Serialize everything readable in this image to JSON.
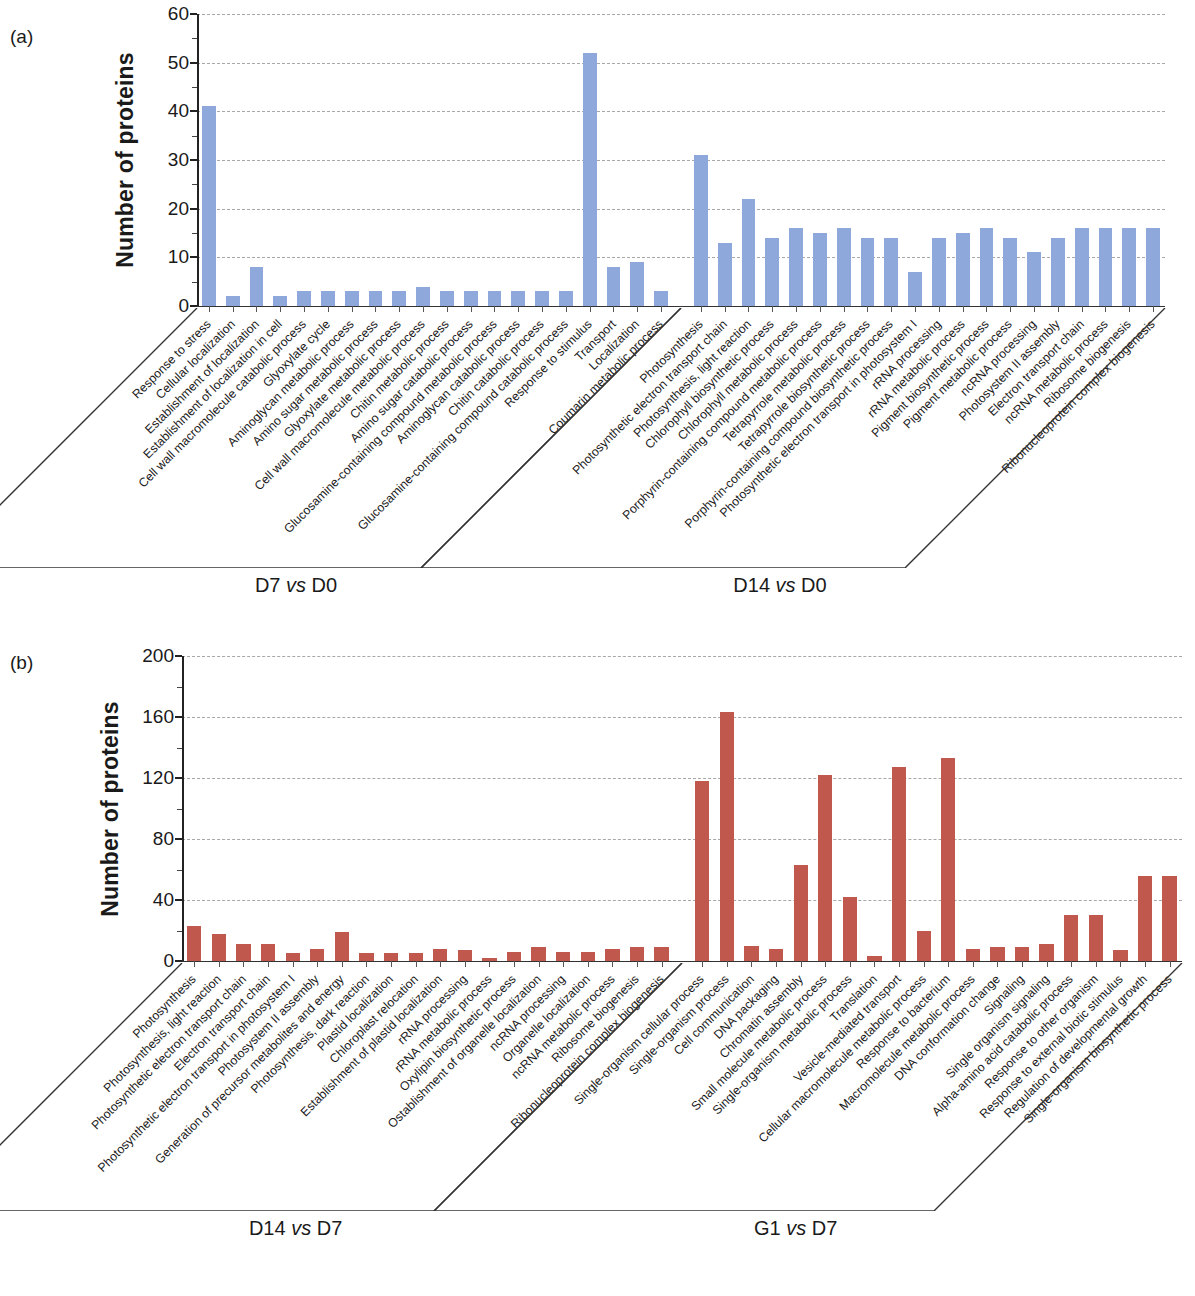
{
  "figure": {
    "panels": [
      {
        "letter": "(a)",
        "ylabel": "Number of proteins",
        "yticks": [
          "0",
          "10",
          "20",
          "30",
          "40",
          "50",
          "60"
        ],
        "groups": [
          {
            "title_prefix": "D7 ",
            "title_vs": "vs",
            "title_suffix": " D0",
            "categories": [
              "Response to stress",
              "Cellular localization",
              "Establishment of localization",
              "Establishment of localization in cell",
              "Cell wall macromolecule catabolic process",
              "Glyoxylate cycle",
              "Aminoglycan metabolic process",
              "Amino sugar metabolic process",
              "Glyoxylate metabolic process",
              "Cell wall macromolecule metabolic process",
              "Chitin metabolic process",
              "Amino sugar catabolic process",
              "Glucosamine-containing compound metabolic process",
              "Aminoglycan catabolic process",
              "Chitin catabolic process",
              "Glucosamine-containing compound catabolic process",
              "Response to stimulus",
              "Transport",
              "Localization",
              "Coumarin metabolic process"
            ],
            "values": [
              41,
              2,
              8,
              2,
              3,
              3,
              3,
              3,
              3,
              4,
              3,
              3,
              3,
              3,
              3,
              3,
              52,
              8,
              9,
              3
            ]
          },
          {
            "title_prefix": "D14 ",
            "title_vs": "vs",
            "title_suffix": " D0",
            "categories": [
              "Photosynthesis",
              "Photosynthetic electron transport chain",
              "Photosynthesis, light reaction",
              "Chlorophyll biosynthetic process",
              "Chlorophyll metabolic process",
              "Porphyrin-containing compound metabolic process",
              "Tetrapyrrole metabolic process",
              "Tetrapyrrole biosynthetic process",
              "Porphyrin-containing compound biosynthetic process",
              "Photosynthetic electron transport in photosystem I",
              "rRNA processing",
              "rRNA metabolic process",
              "Pigment biosynthetic process",
              "Pigment metabolic process",
              "ncRNA processing",
              "Photosystem II assembly",
              "Electron transport chain",
              "ncRNA metabolic process",
              "Ribosome biogenesis",
              "Ribonucleoprotein complex biogenesis"
            ],
            "values": [
              31,
              13,
              22,
              14,
              16,
              15,
              16,
              14,
              14,
              7,
              14,
              15,
              16,
              14,
              11,
              14,
              16,
              16,
              16,
              16
            ]
          }
        ]
      },
      {
        "letter": "(b)",
        "ylabel": "Number of proteins",
        "yticks": [
          "0",
          "40",
          "80",
          "120",
          "160",
          "200"
        ],
        "groups": [
          {
            "title_prefix": "D14 ",
            "title_vs": "vs",
            "title_suffix": " D7",
            "categories": [
              "Photosynthesis",
              "Photosynthesis, light reaction",
              "Photosynthetic electron transport chain",
              "Electron transport chain",
              "Photosynthetic electron transport in photosystem I",
              "Photosystem II assembly",
              "Generation of precursor metabolites and energy",
              "Photosynthesis, dark reaction",
              "Plastid localization",
              "Chloroplast relocation",
              "Establishment of plastid localization",
              "rRNA processing",
              "rRNA metabolic process",
              "Oxylipin biosynthetic process",
              "Ostablishment of organelle localization",
              "ncRNA processing",
              "Organelle localization",
              "ncRNA metabolic process",
              "Ribosome biogenesis",
              "Ribonucleoprotein complex biogenesis"
            ],
            "values": [
              23,
              18,
              11,
              11,
              5,
              8,
              19,
              5,
              5,
              5,
              8,
              7,
              2,
              6,
              9,
              6,
              6,
              8,
              9,
              9
            ]
          },
          {
            "title_prefix": "G1 ",
            "title_vs": "vs",
            "title_suffix": " D7",
            "categories": [
              "Single-organism cellular process",
              "Single-organism process",
              "Cell communication",
              "DNA packaging",
              "Chromatin assembly",
              "Small molecule metabolic process",
              "Single-organism metabolic process",
              "Translation",
              "Vesicle-mediated transport",
              "Cellular macromolecule metabolic process",
              "Response to bacterium",
              "Macromolecule metabolic process",
              "DNA conformation change",
              "Signaling",
              "Single organism signaling",
              "Alpha-amino acid catabolic process",
              "Response to other organism",
              "Response to external biotic stimulus",
              "Regulation of developmental growth",
              "Single-organism biosynthetic process"
            ],
            "values": [
              118,
              163,
              10,
              8,
              63,
              122,
              42,
              3,
              127,
              20,
              133,
              8,
              9,
              9,
              11,
              30,
              30,
              7,
              56,
              56
            ]
          }
        ]
      }
    ]
  },
  "chart_data": [
    {
      "type": "bar",
      "panel": "(a)",
      "title": "",
      "xlabel": "",
      "ylabel": "Number of proteins",
      "ylim": [
        0,
        60
      ],
      "ytick_values": [
        0,
        10,
        20,
        30,
        40,
        50,
        60
      ],
      "grid": true,
      "legend": "none",
      "bar_color": "#8FA8DC",
      "groups": [
        {
          "name": "D7 vs D0",
          "categories": [
            "Response to stress",
            "Cellular localization",
            "Establishment of localization",
            "Establishment of localization in cell",
            "Cell wall macromolecule catabolic process",
            "Glyoxylate cycle",
            "Aminoglycan metabolic process",
            "Amino sugar metabolic process",
            "Glyoxylate metabolic process",
            "Cell wall macromolecule metabolic process",
            "Chitin metabolic process",
            "Amino sugar catabolic process",
            "Glucosamine-containing compound metabolic process",
            "Aminoglycan catabolic process",
            "Chitin catabolic process",
            "Glucosamine-containing compound catabolic process",
            "Response to stimulus",
            "Transport",
            "Localization",
            "Coumarin metabolic process"
          ],
          "values": [
            41,
            2,
            8,
            2,
            3,
            3,
            3,
            3,
            3,
            4,
            3,
            3,
            3,
            3,
            3,
            3,
            52,
            8,
            9,
            3
          ]
        },
        {
          "name": "D14 vs D0",
          "categories": [
            "Photosynthesis",
            "Photosynthetic electron transport chain",
            "Photosynthesis, light reaction",
            "Chlorophyll biosynthetic process",
            "Chlorophyll metabolic process",
            "Porphyrin-containing compound metabolic process",
            "Tetrapyrrole metabolic process",
            "Tetrapyrrole biosynthetic process",
            "Porphyrin-containing compound biosynthetic process",
            "Photosynthetic electron transport in photosystem I",
            "rRNA processing",
            "rRNA metabolic process",
            "Pigment biosynthetic process",
            "Pigment metabolic process",
            "ncRNA processing",
            "Photosystem II assembly",
            "Electron transport chain",
            "ncRNA metabolic process",
            "Ribosome biogenesis",
            "Ribonucleoprotein complex biogenesis"
          ],
          "values": [
            31,
            13,
            22,
            14,
            16,
            15,
            16,
            14,
            14,
            7,
            14,
            15,
            16,
            14,
            11,
            14,
            16,
            16,
            16,
            16
          ]
        }
      ]
    },
    {
      "type": "bar",
      "panel": "(b)",
      "title": "",
      "xlabel": "",
      "ylabel": "Number of proteins",
      "ylim": [
        0,
        200
      ],
      "ytick_values": [
        0,
        40,
        80,
        120,
        160,
        200
      ],
      "grid": true,
      "legend": "none",
      "bar_color": "#C0584E",
      "groups": [
        {
          "name": "D14 vs D7",
          "categories": [
            "Photosynthesis",
            "Photosynthesis, light reaction",
            "Photosynthetic electron transport chain",
            "Electron transport chain",
            "Photosynthetic electron transport in photosystem I",
            "Photosystem II assembly",
            "Generation of precursor metabolites and energy",
            "Photosynthesis, dark reaction",
            "Plastid localization",
            "Chloroplast relocation",
            "Establishment of plastid localization",
            "rRNA processing",
            "rRNA metabolic process",
            "Oxylipin biosynthetic process",
            "Ostablishment of organelle localization",
            "ncRNA processing",
            "Organelle localization",
            "ncRNA metabolic process",
            "Ribosome biogenesis",
            "Ribonucleoprotein complex biogenesis"
          ],
          "values": [
            23,
            18,
            11,
            11,
            5,
            8,
            19,
            5,
            5,
            5,
            8,
            7,
            2,
            6,
            9,
            6,
            6,
            8,
            9,
            9
          ]
        },
        {
          "name": "G1 vs D7",
          "categories": [
            "Single-organism cellular process",
            "Single-organism process",
            "Cell communication",
            "DNA packaging",
            "Chromatin assembly",
            "Small molecule metabolic process",
            "Single-organism metabolic process",
            "Translation",
            "Vesicle-mediated transport",
            "Cellular macromolecule metabolic process",
            "Response to bacterium",
            "Macromolecule metabolic process",
            "DNA conformation change",
            "Signaling",
            "Single organism signaling",
            "Alpha-amino acid catabolic process",
            "Response to other organism",
            "Response to external biotic stimulus",
            "Regulation of developmental growth",
            "Single-organism biosynthetic process"
          ],
          "values": [
            118,
            163,
            10,
            8,
            63,
            122,
            42,
            3,
            127,
            20,
            133,
            8,
            9,
            9,
            11,
            30,
            30,
            7,
            56,
            56
          ]
        }
      ]
    }
  ]
}
